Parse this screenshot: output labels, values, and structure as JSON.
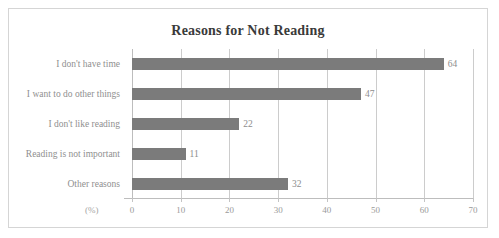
{
  "chart_data": {
    "type": "bar",
    "orientation": "horizontal",
    "title": "Reasons for Not Reading",
    "xlabel": "(%)",
    "ylabel": "",
    "categories": [
      "I don't have time",
      "I want to do other things",
      "I don't like reading",
      "Reading is not important",
      "Other reasons"
    ],
    "values": [
      64,
      47,
      22,
      11,
      32
    ],
    "value_labels": [
      "64",
      "47",
      "22",
      "11",
      "32"
    ],
    "xlim": [
      0,
      70
    ],
    "xticks": [
      0,
      10,
      20,
      30,
      40,
      50,
      60,
      70
    ],
    "xtick_labels": [
      "0",
      "10",
      "20",
      "30",
      "40",
      "50",
      "60",
      "70"
    ],
    "grid": "vertical",
    "legend": "none",
    "colors": {
      "bar": "#7b7b7b",
      "gridline": "#cccccc",
      "axis": "#bdbdbd",
      "title_text": "#3a3a3a",
      "label_text": "#8f8f8f",
      "frame_border": "#d5d5d5",
      "background": "#ffffff"
    }
  }
}
